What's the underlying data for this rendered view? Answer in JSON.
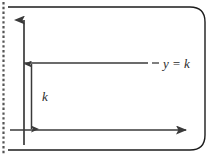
{
  "figure": {
    "type": "coordinate-diagram",
    "labels": {
      "line_label": "y = k",
      "distance_label": "k"
    },
    "axes": {
      "y_axis": {
        "name": "y-axis",
        "direction": "up",
        "arrowhead": true
      },
      "x_axis": {
        "name": "x-axis",
        "direction": "right",
        "arrowhead": true
      }
    },
    "elements": {
      "constant_line": {
        "name": "y = k line",
        "equation": "y = k",
        "orientation": "horizontal"
      },
      "measure": {
        "name": "k distance marker",
        "label": "k",
        "orientation": "vertical",
        "arrowheads": "both"
      },
      "perforation": {
        "name": "page perforation strip",
        "style": "dotted"
      },
      "page_border": {
        "name": "rounded page border",
        "corners": "rounded-right"
      }
    },
    "colors": {
      "ink": "#3a3a3a",
      "border": "#1c1c1c",
      "background": "#ffffff",
      "perforation": "#555555"
    }
  }
}
